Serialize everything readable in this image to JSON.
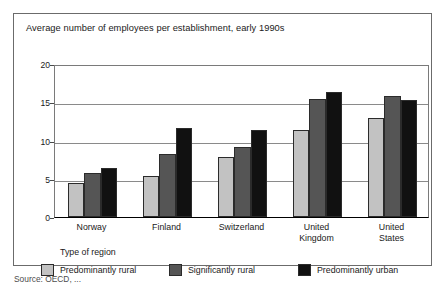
{
  "chart_data": {
    "type": "bar",
    "title": "Average number of employees per establishment, early 1990s",
    "xlabel": "",
    "ylabel": "",
    "ylim": [
      0,
      20
    ],
    "yticks": [
      0,
      5,
      10,
      15,
      20
    ],
    "ytick_labels": [
      "0",
      "5",
      "10",
      "15",
      "20"
    ],
    "grid": true,
    "legend_position": "bottom-left",
    "legend_title": "Type of region",
    "categories": [
      "Norway",
      "Finland",
      "Switzerland",
      "United Kingdom",
      "United States"
    ],
    "series": [
      {
        "name": "Predominantly rural",
        "color": "#c2c2c2",
        "values": [
          4.5,
          5.3,
          7.9,
          11.4,
          13.0
        ]
      },
      {
        "name": "Significantly rural",
        "color": "#555555",
        "values": [
          5.7,
          8.3,
          9.1,
          15.4,
          15.8
        ]
      },
      {
        "name": "Predominantly urban",
        "color": "#111111",
        "values": [
          6.4,
          11.6,
          11.4,
          16.3,
          15.3
        ]
      }
    ]
  },
  "source": {
    "text": "Source: OECD, ..."
  }
}
